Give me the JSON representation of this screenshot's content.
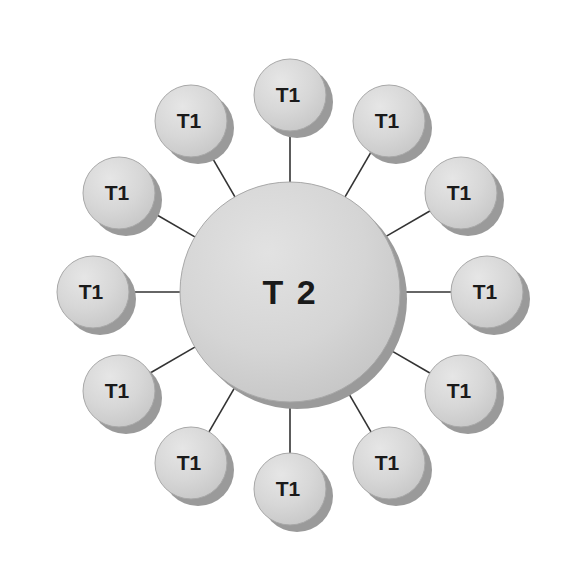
{
  "diagram": {
    "type": "star-topology-network",
    "title": "",
    "background_color": "#ffffff",
    "canvas": {
      "width": 576,
      "height": 588
    },
    "style": {
      "node_fill_top": "#e0e0e0",
      "node_fill_bottom": "#c9c9c9",
      "node_fill_flat": "#d4d4d4",
      "node_rim_color": "#a8a8a8",
      "node_shadow_color": "#9a9a9a",
      "edge_color": "#333333",
      "edge_width": 1.6,
      "label_color": "#1a1a1a",
      "shadow_offset_x": 7,
      "shadow_offset_y": 7
    },
    "hub": {
      "id": "hub",
      "label": "T 2",
      "cx": 290,
      "cy": 292,
      "r": 110
    },
    "leaf_count": 12,
    "leaf_radius": 36,
    "leaf_orbit_radius": 197,
    "leaves": [
      {
        "id": "leaf-1",
        "label": "T1",
        "angle_deg": -90,
        "cx": 290,
        "cy": 95
      },
      {
        "id": "leaf-2",
        "label": "T1",
        "angle_deg": -60,
        "cx": 389,
        "cy": 121
      },
      {
        "id": "leaf-3",
        "label": "T1",
        "angle_deg": -30,
        "cx": 461,
        "cy": 193
      },
      {
        "id": "leaf-4",
        "label": "T1",
        "angle_deg": 0,
        "cx": 487,
        "cy": 292
      },
      {
        "id": "leaf-5",
        "label": "T1",
        "angle_deg": 30,
        "cx": 461,
        "cy": 391
      },
      {
        "id": "leaf-6",
        "label": "T1",
        "angle_deg": 60,
        "cx": 389,
        "cy": 463
      },
      {
        "id": "leaf-7",
        "label": "T1",
        "angle_deg": 90,
        "cx": 290,
        "cy": 489
      },
      {
        "id": "leaf-8",
        "label": "T1",
        "angle_deg": 120,
        "cx": 191,
        "cy": 463
      },
      {
        "id": "leaf-9",
        "label": "T1",
        "angle_deg": 150,
        "cx": 119,
        "cy": 391
      },
      {
        "id": "leaf-10",
        "label": "T1",
        "angle_deg": 180,
        "cx": 93,
        "cy": 292
      },
      {
        "id": "leaf-11",
        "label": "T1",
        "angle_deg": 210,
        "cx": 119,
        "cy": 193
      },
      {
        "id": "leaf-12",
        "label": "T1",
        "angle_deg": 240,
        "cx": 191,
        "cy": 121
      }
    ]
  }
}
